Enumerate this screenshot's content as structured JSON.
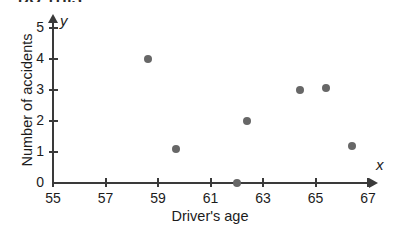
{
  "clipped_header": "DO THIS",
  "chart_data": {
    "type": "scatter",
    "title": "",
    "xlabel": "Driver's age",
    "ylabel": "Number of accidents",
    "x_var_label": "x",
    "y_var_label": "y",
    "xlim": [
      55,
      68
    ],
    "ylim": [
      0,
      5
    ],
    "grid": false,
    "legend": null,
    "marker_color": "#676767",
    "axis_color": "#3a3a3a",
    "x_ticks": [
      55,
      57,
      59,
      61,
      63,
      65,
      67
    ],
    "y_ticks": [
      0,
      1,
      2,
      3,
      4,
      5
    ],
    "x_tick_labels": [
      "55",
      "57",
      "59",
      "61",
      "63",
      "65",
      "67"
    ],
    "y_tick_labels": [
      "0",
      "1",
      "2",
      "3",
      "4",
      "5"
    ],
    "points": [
      {
        "x": 58.6,
        "y": 4.0
      },
      {
        "x": 59.7,
        "y": 1.1
      },
      {
        "x": 62.0,
        "y": 0.0
      },
      {
        "x": 62.4,
        "y": 2.0
      },
      {
        "x": 64.4,
        "y": 3.0
      },
      {
        "x": 65.4,
        "y": 3.05
      },
      {
        "x": 66.4,
        "y": 1.2
      }
    ]
  }
}
